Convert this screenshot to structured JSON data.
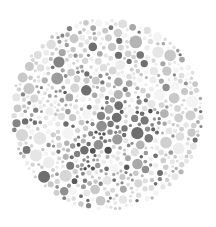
{
  "plate": {
    "title": "Ishihara color vision test plate (grayscale)",
    "type": "pseudoisochromatic-dot-plate",
    "canvas": {
      "width": 216,
      "height": 227,
      "background_color": "#ffffff"
    },
    "circle": {
      "center_x": 107,
      "center_y": 114,
      "radius": 97
    },
    "dots": {
      "min_diameter": 3,
      "max_diameter": 13,
      "approximate_count": 700,
      "packing": "random-non-overlapping",
      "edge_style": "none"
    },
    "palette": {
      "name": "grayscale",
      "background_tones": [
        "#f4f4f4",
        "#ededed",
        "#e6e6e6",
        "#dedede",
        "#d6d6d6",
        "#cfcfcf",
        "#c8c8c8"
      ],
      "figure_tones": [
        "#b4b4b4",
        "#a8a8a8",
        "#9c9c9c",
        "#909090",
        "#848484",
        "#787878",
        "#6e6e6e"
      ],
      "accent_dark_tones": [
        "#646464",
        "#5a5a5a",
        "#505050"
      ],
      "lightest": "#f4f4f4",
      "darkest": "#505050"
    },
    "figure": {
      "description": "hidden numeral formed by darker dots, indistinguishable in grayscale",
      "darker_cluster_centers": [
        {
          "x": 107,
          "y": 112
        },
        {
          "x": 100,
          "y": 138
        },
        {
          "x": 120,
          "y": 100
        },
        {
          "x": 60,
          "y": 78
        },
        {
          "x": 148,
          "y": 118
        },
        {
          "x": 85,
          "y": 160
        },
        {
          "x": 140,
          "y": 165
        }
      ],
      "cluster_radius": 26
    },
    "seed": 20240117
  }
}
